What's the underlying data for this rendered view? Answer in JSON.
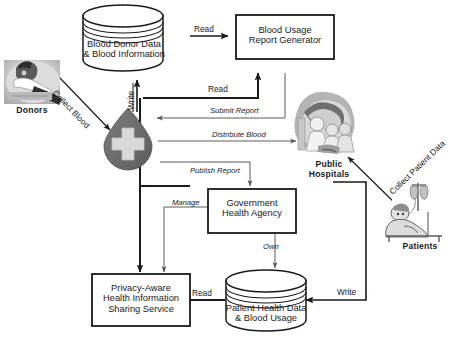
{
  "diagram": {
    "type": "dataflow-diagram",
    "palette": {
      "stroke": "#1a1a1a",
      "fill_white": "#ffffff",
      "blood_drop_fill": "#6b6b6b",
      "blood_cross_fill": "#d8d8d8",
      "photo_gray_light": "#c9c9c9",
      "photo_gray_mid": "#9a9a9a",
      "photo_gray_dark": "#545454"
    },
    "nodes": {
      "blood_donor_db": {
        "shape": "cylinder",
        "label": "Blood Donor  Data\n& Blood Information"
      },
      "report_generator": {
        "shape": "rectangle",
        "label": "Blood Usage\nReport Generator"
      },
      "blood_drop": {
        "shape": "blood-drop-icon",
        "label": ""
      },
      "government_agency": {
        "shape": "rectangle",
        "label": "Government\nHealth Agency"
      },
      "sharing_service": {
        "shape": "rectangle",
        "label": "Privacy-Aware\nHealth Information\nSharing Service"
      },
      "patient_db": {
        "shape": "cylinder",
        "label": "Patient Health Data\n& Blood Usage"
      },
      "donors": {
        "shape": "photo",
        "caption": "Donors"
      },
      "public_hospitals": {
        "shape": "photo",
        "caption": "Public\nHospitals"
      },
      "patients": {
        "shape": "photo",
        "caption": "Patients"
      }
    },
    "edges": [
      {
        "id": "e-read-donordb",
        "label": "Read",
        "style": "upright",
        "from": "blood_donor_db",
        "to": "report_generator"
      },
      {
        "id": "e-write-donordb",
        "label": "Write",
        "style": "upright",
        "from": "blood_drop",
        "to": "blood_donor_db"
      },
      {
        "id": "e-collect-blood",
        "label": "Collect Blood",
        "style": "upright",
        "from": "donors",
        "to": "blood_drop"
      },
      {
        "id": "e-read-generator",
        "label": "Read",
        "style": "upright",
        "from": "blood_drop",
        "to": "report_generator"
      },
      {
        "id": "e-submit-report",
        "label": "Submit Report",
        "style": "italic",
        "from": "report_generator",
        "to": "blood_drop"
      },
      {
        "id": "e-distribute-blood",
        "label": "Distribute Blood",
        "style": "italic",
        "from": "blood_drop",
        "to": "public_hospitals"
      },
      {
        "id": "e-publish-report",
        "label": "Publish Report",
        "style": "italic",
        "from": "blood_drop",
        "to": "government_agency"
      },
      {
        "id": "e-manage",
        "label": "Manage",
        "style": "italic",
        "from": "government_agency",
        "to": "sharing_service"
      },
      {
        "id": "e-own",
        "label": "Own",
        "style": "italic",
        "from": "government_agency",
        "to": "patient_db"
      },
      {
        "id": "e-read-patientdb",
        "label": "Read",
        "style": "upright",
        "from": "patient_db",
        "to": "sharing_service"
      },
      {
        "id": "e-write-patientdb",
        "label": "Write",
        "style": "upright",
        "from": "public_hospitals",
        "to": "patient_db"
      },
      {
        "id": "e-collect-patient",
        "label": "Collect Patient\nData",
        "style": "upright",
        "from": "patients",
        "to": "public_hospitals"
      }
    ]
  }
}
